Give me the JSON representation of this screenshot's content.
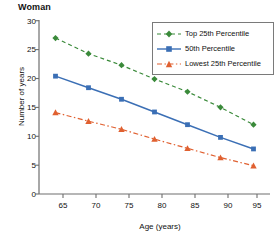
{
  "chart_data": {
    "type": "line",
    "title": "Woman",
    "xlabel": "Age (years)",
    "ylabel": "Number of years",
    "x": [
      65,
      70,
      75,
      80,
      85,
      90,
      95
    ],
    "xlim": [
      62.5,
      97.5
    ],
    "ylim": [
      0,
      30
    ],
    "xticks": [
      "65",
      "70",
      "75",
      "80",
      "85",
      "90",
      "95"
    ],
    "yticks": [
      "0",
      "5",
      "10",
      "15",
      "20",
      "25",
      "30"
    ],
    "grid": false,
    "legend_position": "top-right",
    "series": [
      {
        "name": "Top 25th Percentile",
        "color": "#3a8a3a",
        "linestyle": "dashed",
        "marker": "diamond",
        "values": [
          27.0,
          24.3,
          22.3,
          19.9,
          17.7,
          15.0,
          12.0
        ]
      },
      {
        "name": "50th Percentile",
        "color": "#3b6fb5",
        "linestyle": "solid",
        "marker": "square",
        "values": [
          20.4,
          18.4,
          16.4,
          14.2,
          12.0,
          9.8,
          7.8
        ]
      },
      {
        "name": "Lowest 25th Percentile",
        "color": "#e06030",
        "linestyle": "dashdot",
        "marker": "triangle",
        "values": [
          14.1,
          12.6,
          11.2,
          9.5,
          7.9,
          6.3,
          4.9
        ]
      }
    ]
  },
  "legend": {
    "items": [
      {
        "label": "Top 25th Percentile"
      },
      {
        "label": "50th Percentile"
      },
      {
        "label": "Lowest 25th Percentile"
      }
    ]
  },
  "axes": {
    "y_tick_labels": [
      "30",
      "25",
      "20",
      "15",
      "10",
      "5",
      "0"
    ],
    "x_tick_labels": [
      "65",
      "70",
      "75",
      "80",
      "85",
      "90",
      "95"
    ]
  }
}
